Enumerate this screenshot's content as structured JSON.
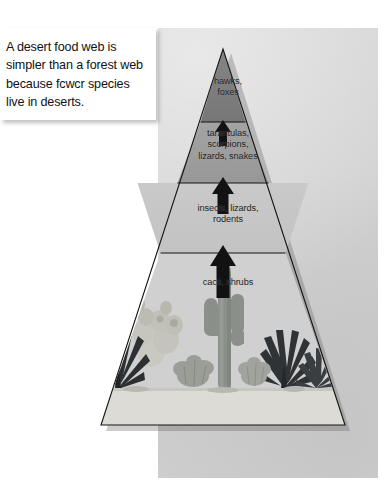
{
  "figure": {
    "kind": "energy-pyramid-diagram",
    "panel_background_color": "#d3d3d3",
    "page_background_color": "#ffffff"
  },
  "callout": {
    "text": "A desert food web is simpler than a forest web because fcwcr species live in deserts.",
    "background_color": "#ffffff",
    "text_color": "#101214"
  },
  "pyramid": {
    "outline_color": "#1a1a1a",
    "tiers": [
      {
        "index": 1,
        "position": "top",
        "label": "hawks,\nfoxes",
        "fill_color": "#7e7e7e"
      },
      {
        "index": 2,
        "position": "upper-middle",
        "label": "tarantulas,\nscorpions,\nlizards, snakes",
        "fill_color": "#9d9d9d"
      },
      {
        "index": 3,
        "position": "lower-middle",
        "label": "insects, lizards,\nrodents",
        "fill_color": "#c6c6c6"
      },
      {
        "index": 4,
        "position": "base",
        "label": "cacti, shrubs",
        "fill_color": "#cfcfcf"
      }
    ],
    "arrows": [
      {
        "index": 1,
        "between": "cacti, shrubs -> insects, lizards, rodents",
        "direction": "up",
        "color": "#111111"
      },
      {
        "index": 2,
        "between": "insects, lizards, rodents -> tarantulas, scorpions, lizards, snakes",
        "direction": "up",
        "color": "#111111"
      },
      {
        "index": 3,
        "between": "tarantulas, scorpions, lizards, snakes -> hawks, foxes",
        "direction": "up",
        "color": "#111111"
      }
    ]
  },
  "desert_scene": {
    "ground_color": "#d9d7d2",
    "plants": [
      {
        "name": "agave-plant-left",
        "tone": "#2e3234"
      },
      {
        "name": "prickly-pear-cactus",
        "tone": "#c3c3bd"
      },
      {
        "name": "shrub-center-left",
        "tone": "#8d9189"
      },
      {
        "name": "saguaro-cactus",
        "tone": "#8e928c"
      },
      {
        "name": "shrub-center-right",
        "tone": "#9a9e96"
      },
      {
        "name": "agave-plant-right",
        "tone": "#303436"
      },
      {
        "name": "agave-plant-far-right",
        "tone": "#3a3e40"
      }
    ]
  }
}
